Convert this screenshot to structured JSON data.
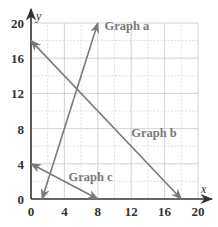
{
  "chart_data": {
    "type": "line",
    "title": "",
    "xlabel": "x",
    "ylabel": "y",
    "xlim": [
      0,
      20
    ],
    "ylim": [
      0,
      20
    ],
    "grid": true,
    "grid_step": 2,
    "x_ticks": [
      0,
      4,
      8,
      12,
      16,
      20
    ],
    "y_ticks": [
      0,
      4,
      8,
      12,
      16,
      20
    ],
    "series": [
      {
        "name": "Graph a",
        "equation": "y = 3x - 4",
        "points": [
          [
            1.33,
            0
          ],
          [
            8,
            20
          ]
        ],
        "arrows": "both",
        "label_pos": [
          8.8,
          19.2
        ]
      },
      {
        "name": "Graph b",
        "equation": "y = 18 - x",
        "points": [
          [
            0,
            18
          ],
          [
            18,
            0
          ]
        ],
        "arrows": "both",
        "label_pos": [
          12,
          7
        ]
      },
      {
        "name": "Graph c",
        "equation": "y = 4 - x/2",
        "points": [
          [
            0,
            4
          ],
          [
            8,
            0
          ]
        ],
        "arrows": "both",
        "label_pos": [
          4.5,
          2
        ]
      }
    ],
    "legend": "inline labels",
    "line_color": "#7a7a7a"
  }
}
